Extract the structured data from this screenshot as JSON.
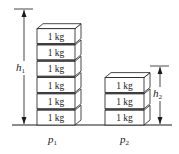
{
  "diagram": {
    "type": "physics-figure",
    "colors": {
      "stroke": "#1a1a1a",
      "block_front": "#ffffff",
      "block_top": "#ffffff",
      "block_side": "#ffffff"
    },
    "block_label": "1 kg",
    "stacks": [
      {
        "id": "left",
        "block_count": 6,
        "blocks": [
          "1 kg",
          "1 kg",
          "1 kg",
          "1 kg",
          "1 kg",
          "1 kg"
        ],
        "height_symbol": "h",
        "height_subscript": "1",
        "pressure_symbol": "p",
        "pressure_subscript": "1"
      },
      {
        "id": "right",
        "block_count": 3,
        "blocks": [
          "1 kg",
          "1 kg",
          "1 kg"
        ],
        "height_symbol": "h",
        "height_subscript": "2",
        "pressure_symbol": "p",
        "pressure_subscript": "2"
      }
    ]
  }
}
